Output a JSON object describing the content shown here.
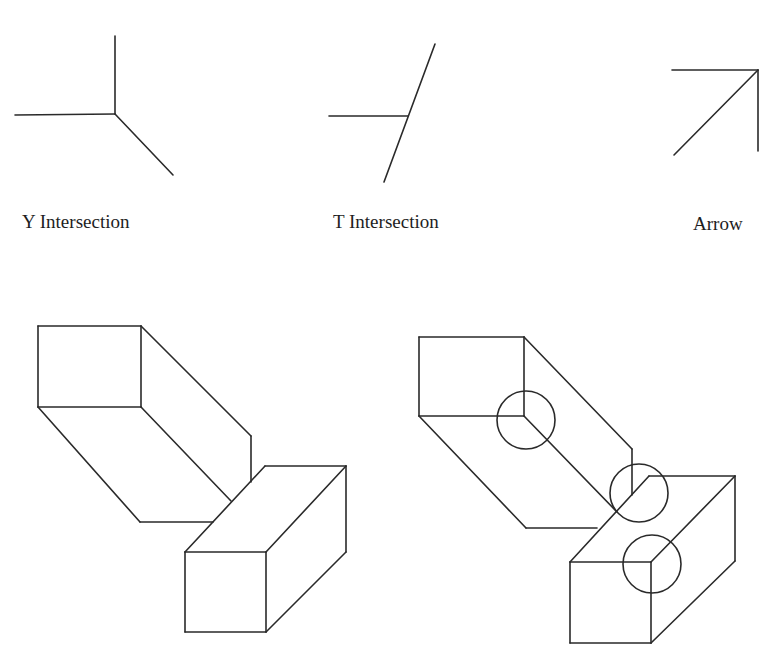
{
  "junction_types": [
    {
      "id": "y",
      "label": "Y Intersection",
      "label_pos": [
        22,
        212
      ],
      "segments": [
        [
          [
            115,
            36
          ],
          [
            115,
            114
          ]
        ],
        [
          [
            15,
            115
          ],
          [
            115,
            114
          ]
        ],
        [
          [
            115,
            114
          ],
          [
            173,
            175
          ]
        ]
      ]
    },
    {
      "id": "t",
      "label": "T Intersection",
      "label_pos": [
        333,
        212
      ],
      "segments": [
        [
          [
            329,
            116
          ],
          [
            408,
            116
          ]
        ],
        [
          [
            435,
            44
          ],
          [
            384,
            182
          ]
        ]
      ]
    },
    {
      "id": "arrow",
      "label": "Arrow",
      "label_pos": [
        693,
        214
      ],
      "segments": [
        [
          [
            672,
            70
          ],
          [
            758,
            70
          ]
        ],
        [
          [
            758,
            70
          ],
          [
            758,
            151
          ]
        ],
        [
          [
            758,
            70
          ],
          [
            674,
            155
          ]
        ]
      ]
    }
  ],
  "scenes": [
    {
      "id": "plain-boxes",
      "segments": [
        [
          [
            38,
            326
          ],
          [
            141,
            326
          ]
        ],
        [
          [
            141,
            326
          ],
          [
            141,
            407
          ]
        ],
        [
          [
            141,
            407
          ],
          [
            38,
            407
          ]
        ],
        [
          [
            38,
            407
          ],
          [
            38,
            326
          ]
        ],
        [
          [
            141,
            326
          ],
          [
            251,
            436
          ]
        ],
        [
          [
            251,
            436
          ],
          [
            251,
            482
          ]
        ],
        [
          [
            38,
            407
          ],
          [
            140,
            522
          ]
        ],
        [
          [
            140,
            522
          ],
          [
            213,
            522
          ]
        ],
        [
          [
            141,
            407
          ],
          [
            231,
            501
          ]
        ],
        [
          [
            185,
            552
          ],
          [
            266,
            552
          ]
        ],
        [
          [
            266,
            552
          ],
          [
            266,
            632
          ]
        ],
        [
          [
            266,
            632
          ],
          [
            185,
            632
          ]
        ],
        [
          [
            185,
            632
          ],
          [
            185,
            552
          ]
        ],
        [
          [
            185,
            552
          ],
          [
            265,
            466
          ]
        ],
        [
          [
            265,
            466
          ],
          [
            346,
            466
          ]
        ],
        [
          [
            346,
            466
          ],
          [
            266,
            552
          ]
        ],
        [
          [
            346,
            466
          ],
          [
            346,
            552
          ]
        ],
        [
          [
            346,
            552
          ],
          [
            266,
            632
          ]
        ]
      ],
      "circles": []
    },
    {
      "id": "circled-boxes",
      "segments": [
        [
          [
            419,
            337
          ],
          [
            524,
            337
          ]
        ],
        [
          [
            524,
            337
          ],
          [
            524,
            416
          ]
        ],
        [
          [
            524,
            416
          ],
          [
            419,
            416
          ]
        ],
        [
          [
            419,
            416
          ],
          [
            419,
            337
          ]
        ],
        [
          [
            524,
            337
          ],
          [
            632,
            449
          ]
        ],
        [
          [
            632,
            449
          ],
          [
            632,
            495
          ]
        ],
        [
          [
            419,
            416
          ],
          [
            526,
            528
          ]
        ],
        [
          [
            526,
            528
          ],
          [
            597,
            528
          ]
        ],
        [
          [
            524,
            416
          ],
          [
            617,
            512
          ]
        ],
        [
          [
            570,
            562
          ],
          [
            651,
            562
          ]
        ],
        [
          [
            651,
            562
          ],
          [
            651,
            643
          ]
        ],
        [
          [
            651,
            643
          ],
          [
            570,
            643
          ]
        ],
        [
          [
            570,
            643
          ],
          [
            570,
            562
          ]
        ],
        [
          [
            570,
            562
          ],
          [
            649,
            476
          ]
        ],
        [
          [
            649,
            476
          ],
          [
            735,
            476
          ]
        ],
        [
          [
            735,
            476
          ],
          [
            651,
            562
          ]
        ],
        [
          [
            735,
            476
          ],
          [
            735,
            561
          ]
        ],
        [
          [
            735,
            561
          ],
          [
            651,
            643
          ]
        ]
      ],
      "circles": [
        {
          "label": "y-junction-circle",
          "cx": 526,
          "cy": 420,
          "r": 29
        },
        {
          "label": "t-junction-circle",
          "cx": 639,
          "cy": 493,
          "r": 29
        },
        {
          "label": "arrow-junction-circle",
          "cx": 652,
          "cy": 564,
          "r": 29
        }
      ]
    }
  ]
}
